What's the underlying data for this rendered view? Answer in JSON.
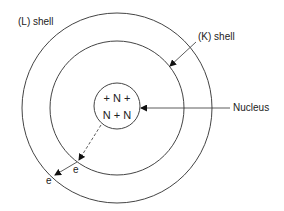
{
  "diagram": {
    "labels": {
      "l_shell": "(L) shell",
      "k_shell": "(K) shell",
      "nucleus": "Nucleus",
      "nucleus_line1": "+ N +",
      "nucleus_line2": "N + N",
      "electron_k": "e",
      "electron_l": "e"
    },
    "colors": {
      "stroke": "#333333",
      "text": "#222222",
      "background": "#ffffff"
    }
  }
}
